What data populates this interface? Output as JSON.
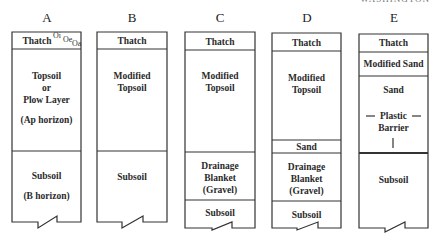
{
  "header": {
    "corner_text": "WASHINGTON"
  },
  "profiles": [
    {
      "label": "A",
      "layers": [
        "Thatch",
        "Topsoil",
        "or",
        "Plow Layer",
        "(Ap horizon)",
        "Subsoil",
        "(B horizon)"
      ],
      "thatch_superscripts": [
        "Oi",
        "Oe",
        "Oa"
      ]
    },
    {
      "label": "B",
      "layers": [
        "Thatch",
        "Modified",
        "Topsoil",
        "Subsoil"
      ]
    },
    {
      "label": "C",
      "layers": [
        "Thatch",
        "Modified",
        "Topsoil",
        "Drainage",
        "Blanket",
        "(Gravel)",
        "Subsoil"
      ]
    },
    {
      "label": "D",
      "layers": [
        "Thatch",
        "Modified",
        "Topsoil",
        "Sand",
        "Drainage",
        "Blanket",
        "(Gravel)",
        "Subsoil"
      ]
    },
    {
      "label": "E",
      "layers": [
        "Thatch",
        "Modified  Sand",
        "Sand",
        "Plastic",
        "Barrier",
        "Subsoil"
      ]
    }
  ],
  "colors": {
    "line": "#333333",
    "background": "#ffffff",
    "text": "#2a2a2a"
  }
}
